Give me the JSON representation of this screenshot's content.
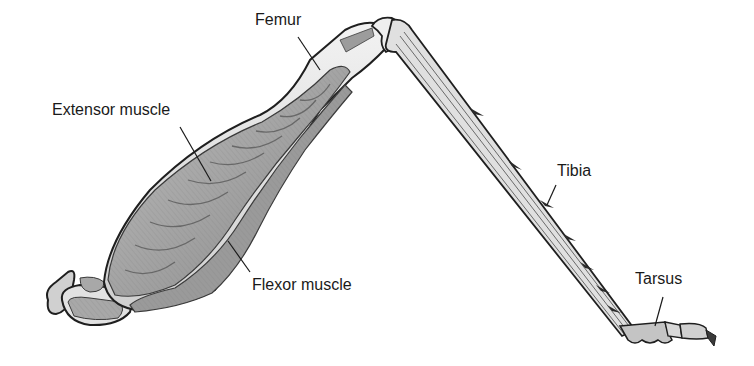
{
  "diagram": {
    "labels": {
      "femur": "Femur",
      "extensor": "Extensor muscle",
      "flexor": "Flexor muscle",
      "tibia": "Tibia",
      "tarsus": "Tarsus"
    },
    "colors": {
      "background": "#ffffff",
      "outline": "#1f1f1f",
      "muscle_fill": "#a9a9a9",
      "muscle_dark": "#8a8a8a",
      "bone_fill": "#e6e6e6",
      "text": "#1a1a1a"
    }
  }
}
